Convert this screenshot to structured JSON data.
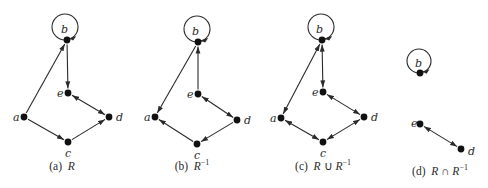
{
  "colors": {
    "ink": "#2a2a2a",
    "node": "#111111",
    "background": "#ffffff"
  },
  "panels": [
    {
      "id": "a",
      "caption_tag": "(a)",
      "caption_parts": [
        {
          "text": "R",
          "italic": true
        }
      ],
      "caption_text": "(a) R",
      "caption_x": 62,
      "caption_y": 170,
      "nodes": [
        {
          "id": "a",
          "x": 24,
          "y": 117,
          "lx": 13,
          "ly": 121
        },
        {
          "id": "b",
          "x": 67,
          "y": 40,
          "lx": 61,
          "ly": 33
        },
        {
          "id": "c",
          "x": 68,
          "y": 142,
          "lx": 65,
          "ly": 157
        },
        {
          "id": "d",
          "x": 109,
          "y": 117,
          "lx": 116,
          "ly": 121
        },
        {
          "id": "e",
          "x": 68,
          "y": 93,
          "lx": 57,
          "ly": 97
        }
      ],
      "loops": [
        {
          "node": "b",
          "cx": 65,
          "cy": 27,
          "r": 13
        }
      ],
      "edges": [
        {
          "from": "a",
          "to": "b",
          "arrow_end": true,
          "arrow_start": false
        },
        {
          "from": "b",
          "to": "e",
          "arrow_end": true,
          "arrow_start": false
        },
        {
          "from": "a",
          "to": "c",
          "arrow_end": true,
          "arrow_start": false
        },
        {
          "from": "c",
          "to": "d",
          "arrow_end": true,
          "arrow_start": false
        },
        {
          "from": "e",
          "to": "d",
          "arrow_end": true,
          "arrow_start": true
        }
      ]
    },
    {
      "id": "b",
      "caption_tag": "(b)",
      "caption_parts": [
        {
          "text": "R",
          "italic": true
        },
        {
          "text": "−1",
          "sup": true
        }
      ],
      "caption_text": "(b) R^−1",
      "caption_x": 192,
      "caption_y": 170,
      "nodes": [
        {
          "id": "a",
          "x": 155,
          "y": 117,
          "lx": 144,
          "ly": 121
        },
        {
          "id": "b",
          "x": 198,
          "y": 42,
          "lx": 192,
          "ly": 35
        },
        {
          "id": "c",
          "x": 197,
          "y": 144,
          "lx": 194,
          "ly": 159
        },
        {
          "id": "d",
          "x": 237,
          "y": 120,
          "lx": 244,
          "ly": 124
        },
        {
          "id": "e",
          "x": 198,
          "y": 94,
          "lx": 187,
          "ly": 98
        }
      ],
      "loops": [
        {
          "node": "b",
          "cx": 197,
          "cy": 29,
          "r": 13
        }
      ],
      "edges": [
        {
          "from": "b",
          "to": "a",
          "arrow_end": true,
          "arrow_start": false
        },
        {
          "from": "e",
          "to": "b",
          "arrow_end": true,
          "arrow_start": false
        },
        {
          "from": "c",
          "to": "a",
          "arrow_end": true,
          "arrow_start": false
        },
        {
          "from": "d",
          "to": "c",
          "arrow_end": true,
          "arrow_start": false
        },
        {
          "from": "e",
          "to": "d",
          "arrow_end": true,
          "arrow_start": true
        }
      ]
    },
    {
      "id": "c",
      "caption_tag": "(c)",
      "caption_parts": [
        {
          "text": "R",
          "italic": true
        },
        {
          "text": " ∪ "
        },
        {
          "text": "R",
          "italic": true
        },
        {
          "text": "−1",
          "sup": true
        }
      ],
      "caption_text": "(c) R ∪ R^−1",
      "caption_x": 323,
      "caption_y": 170,
      "nodes": [
        {
          "id": "a",
          "x": 281,
          "y": 118,
          "lx": 270,
          "ly": 122
        },
        {
          "id": "b",
          "x": 322,
          "y": 40,
          "lx": 316,
          "ly": 33
        },
        {
          "id": "c",
          "x": 323,
          "y": 142,
          "lx": 320,
          "ly": 157
        },
        {
          "id": "d",
          "x": 364,
          "y": 117,
          "lx": 371,
          "ly": 121
        },
        {
          "id": "e",
          "x": 323,
          "y": 92,
          "lx": 312,
          "ly": 96
        }
      ],
      "loops": [
        {
          "node": "b",
          "cx": 321,
          "cy": 27,
          "r": 13
        }
      ],
      "edges": [
        {
          "from": "a",
          "to": "b",
          "arrow_end": true,
          "arrow_start": true
        },
        {
          "from": "b",
          "to": "e",
          "arrow_end": true,
          "arrow_start": true
        },
        {
          "from": "a",
          "to": "c",
          "arrow_end": true,
          "arrow_start": true
        },
        {
          "from": "c",
          "to": "d",
          "arrow_end": true,
          "arrow_start": true
        },
        {
          "from": "e",
          "to": "d",
          "arrow_end": true,
          "arrow_start": true
        }
      ]
    },
    {
      "id": "d",
      "caption_tag": "(d)",
      "caption_parts": [
        {
          "text": "R",
          "italic": true
        },
        {
          "text": " ∩ "
        },
        {
          "text": "R",
          "italic": true
        },
        {
          "text": "−1",
          "sup": true
        }
      ],
      "caption_text": "(d) R ∩ R^−1",
      "caption_x": 440,
      "caption_y": 175,
      "nodes": [
        {
          "id": "b",
          "x": 420,
          "y": 73,
          "lx": 415,
          "ly": 67
        },
        {
          "id": "d",
          "x": 461,
          "y": 149,
          "lx": 468,
          "ly": 155
        },
        {
          "id": "e",
          "x": 420,
          "y": 124,
          "lx": 411,
          "ly": 127
        }
      ],
      "loops": [
        {
          "node": "b",
          "cx": 419,
          "cy": 61,
          "r": 12
        }
      ],
      "edges": [
        {
          "from": "e",
          "to": "d",
          "arrow_end": true,
          "arrow_start": true
        }
      ]
    }
  ]
}
